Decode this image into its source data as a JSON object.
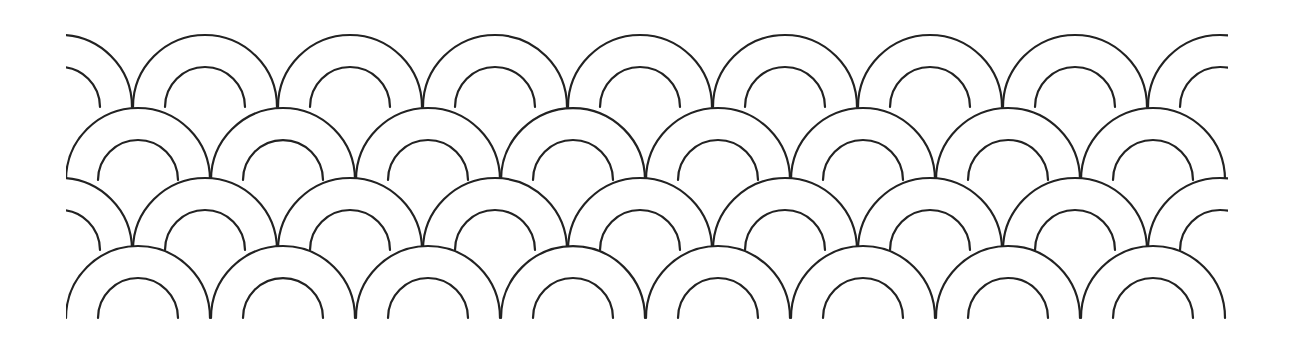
{
  "pattern": {
    "name": "seigaiha-scale-pattern",
    "background": "#ffffff",
    "stroke": "#222222",
    "outer_radius": 72,
    "inner_radius": 40,
    "clip": {
      "x_min": 66,
      "x_max": 1228
    },
    "rows": [
      {
        "base_y": 107,
        "centers_x": [
          60,
          205,
          350,
          495,
          640,
          785,
          930,
          1075,
          1220
        ]
      },
      {
        "base_y": 180,
        "centers_x": [
          138,
          283,
          428,
          573,
          718,
          863,
          1008,
          1153
        ]
      },
      {
        "base_y": 250,
        "centers_x": [
          60,
          205,
          350,
          495,
          640,
          785,
          930,
          1075,
          1220
        ]
      },
      {
        "base_y": 318,
        "centers_x": [
          138,
          283,
          428,
          573,
          718,
          863,
          1008,
          1153
        ]
      }
    ]
  }
}
